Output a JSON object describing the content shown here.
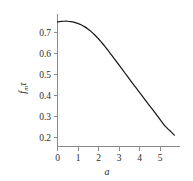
{
  "chart_data": {
    "type": "line",
    "title": "",
    "subtitle": "",
    "xlabel": "a",
    "ylabel": "fₘτ",
    "ylabel_main": "f",
    "ylabel_subscript": "m",
    "ylabel_tail": "τ",
    "xlim": [
      0,
      5.45
    ],
    "ylim": [
      0.16,
      0.8
    ],
    "grid": false,
    "legend": null,
    "legend_position": "none",
    "xticks": [
      0,
      1,
      2,
      3,
      4,
      5
    ],
    "xtick_labels": [
      "0",
      "1",
      "2",
      "3",
      "4",
      "5"
    ],
    "yticks": [
      0.2,
      0.3,
      0.4,
      0.5,
      0.6,
      0.7
    ],
    "ytick_labels": [
      "0.2",
      "0.3",
      "0.4",
      "0.5",
      "0.6",
      "0.7"
    ],
    "series": [
      {
        "name": "fm-tau-curve",
        "color": "#1a1a1a",
        "x": [
          0.0,
          0.15,
          0.3,
          0.45,
          0.6,
          0.75,
          0.9,
          1.05,
          1.2,
          1.35,
          1.5,
          1.65,
          1.8,
          1.95,
          2.1,
          2.25,
          2.4,
          2.55,
          2.7,
          2.85,
          3.0,
          3.2,
          3.4,
          3.6,
          3.8,
          4.0,
          4.2,
          4.4,
          4.6,
          4.8,
          5.0,
          5.2
        ],
        "y": [
          0.762,
          0.764,
          0.765,
          0.765,
          0.763,
          0.76,
          0.755,
          0.748,
          0.739,
          0.728,
          0.715,
          0.7,
          0.683,
          0.664,
          0.645,
          0.624,
          0.603,
          0.581,
          0.559,
          0.537,
          0.515,
          0.486,
          0.457,
          0.428,
          0.4,
          0.371,
          0.343,
          0.314,
          0.285,
          0.257,
          0.236,
          0.215
        ]
      }
    ],
    "annotations": []
  },
  "axes": {
    "y_tick_color": "#2b2b2b",
    "x_tick_color": "#2b2b2b",
    "spine_color": "#8a8a8a",
    "background": "#ffffff"
  }
}
